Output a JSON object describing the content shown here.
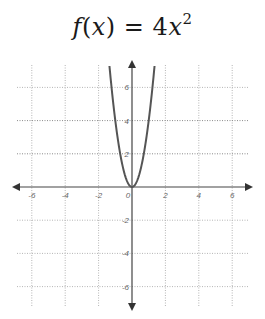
{
  "title": {
    "func_name": "f",
    "open_paren": "(",
    "var": "x",
    "close_paren": ")",
    "equals": " = ",
    "coef": "4",
    "var2": "x",
    "exponent": "2"
  },
  "chart_data": {
    "type": "line",
    "function": "4*x^2",
    "series": [
      {
        "name": "f(x) = 4x^2",
        "x": [
          -1.35,
          -1.25,
          -1,
          -0.75,
          -0.5,
          -0.25,
          0,
          0.25,
          0.5,
          0.75,
          1,
          1.25,
          1.35
        ],
        "y": [
          7.29,
          6.25,
          4,
          2.25,
          1,
          0.25,
          0,
          0.25,
          1,
          2.25,
          4,
          6.25,
          7.29
        ]
      }
    ],
    "xlabel": "",
    "ylabel": "",
    "xlim": [
      -7,
      7
    ],
    "ylim": [
      -7,
      7.4
    ],
    "x_ticks": [
      -6,
      -4,
      -2,
      0,
      2,
      4,
      6
    ],
    "y_ticks": [
      -6,
      -4,
      -2,
      2,
      4,
      6
    ],
    "x_tick_labels": [
      "-6",
      "-4",
      "-2",
      "0",
      "2",
      "4",
      "6"
    ],
    "y_tick_labels": [
      "6",
      "4",
      "2",
      "-2",
      "-4",
      "-6"
    ],
    "grid": true,
    "grid_style": "dotted",
    "axes_arrows": true,
    "legend": null
  },
  "colors": {
    "curve": "#555555",
    "axis": "#444444",
    "grid": "#b5b5b5",
    "text": "#1a1a1a"
  }
}
